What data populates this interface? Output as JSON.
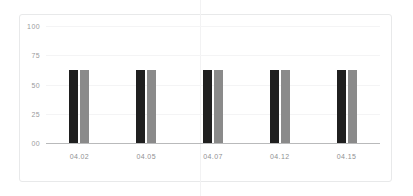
{
  "chart_data": {
    "type": "bar",
    "title": "",
    "subtitle": "",
    "xlabel": "",
    "ylabel": "",
    "categories": [
      "04.02",
      "04.05",
      "04.07",
      "04.12",
      "04.15"
    ],
    "series": [
      {
        "name": "series-1",
        "color": "#1f1f1f",
        "values": [
          62,
          62,
          62,
          62,
          62
        ]
      },
      {
        "name": "series-2",
        "color": "#8a8a8a",
        "values": [
          62,
          62,
          62,
          62,
          62
        ]
      }
    ],
    "ylim": [
      0,
      100
    ],
    "yticks": [
      "100",
      "75",
      "50",
      "25",
      "00"
    ],
    "ytick_values": [
      100,
      75,
      50,
      25,
      0
    ],
    "grid": true,
    "legend": "none",
    "annotations": []
  },
  "colors": {
    "series_a": "#1f1f1f",
    "series_b": "#8a8a8a",
    "gridline": "#f4f4f5",
    "axis": "#b9babb",
    "tick_label": "#9a9b9d",
    "frame": "#e8e9ea",
    "background": "#ffffff"
  }
}
